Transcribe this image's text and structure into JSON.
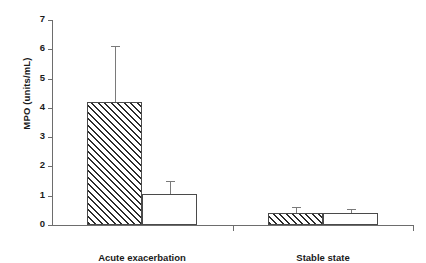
{
  "chart_data": {
    "type": "bar",
    "title": "",
    "xlabel": "",
    "ylabel": "MPO (units/mL)",
    "categories": [
      "Acute exacerbation",
      "Stable state"
    ],
    "ylim": [
      0,
      7
    ],
    "yticks": [
      0,
      1,
      2,
      3,
      4,
      5,
      6,
      7
    ],
    "ytick_labels": [
      "0",
      "1",
      "2",
      "3",
      "4",
      "5",
      "6",
      "7"
    ],
    "grid": false,
    "legend": "none",
    "series": [
      {
        "name": "hatched",
        "fill": "diagonal-hatch",
        "values": [
          4.2,
          0.4
        ],
        "errors_upper": [
          6.1,
          0.6
        ]
      },
      {
        "name": "open",
        "fill": "white",
        "values": [
          1.05,
          0.4
        ],
        "errors_upper": [
          1.5,
          0.55
        ]
      }
    ]
  },
  "axis": {
    "y_title": "MPO (units/mL)",
    "tick0": "0",
    "tick1": "1",
    "tick2": "2",
    "tick3": "3",
    "tick4": "4",
    "tick5": "5",
    "tick6": "6",
    "tick7": "7"
  },
  "groups": {
    "g0": "Acute exacerbation",
    "g1": "Stable state"
  },
  "colors": {
    "axis": "#6d6d6d",
    "bar_edge": "#4a4a4a",
    "hatch": "#2b2b2b",
    "error": "#7a7a7a",
    "background": "#ffffff",
    "text": "#1a1a1a"
  }
}
